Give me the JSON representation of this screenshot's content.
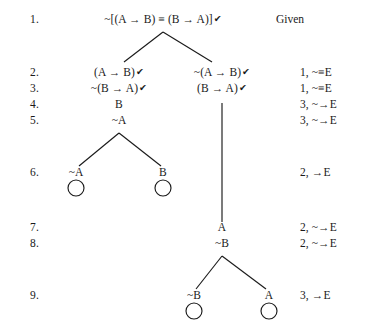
{
  "diagram": {
    "symbols": {
      "negation": "~",
      "conditional": "→",
      "biconditional": "≡",
      "check": "✔"
    },
    "line_numbers": [
      "1.",
      "2.",
      "3.",
      "4.",
      "5.",
      "6.",
      "7.",
      "8.",
      "9."
    ],
    "given_label": "Given",
    "nodes": [
      {
        "id": "n1",
        "line": 1,
        "text": "~[(A → B) ≡ (B → A)]",
        "checked": true,
        "x": 163,
        "y": 20
      },
      {
        "id": "n2L",
        "line": 2,
        "text": "(A → B)",
        "checked": true,
        "x": 119,
        "y": 73
      },
      {
        "id": "n3L",
        "line": 3,
        "text": "~(B → A)",
        "checked": true,
        "x": 119,
        "y": 89
      },
      {
        "id": "n4L",
        "line": 4,
        "text": "B",
        "checked": false,
        "x": 119,
        "y": 105
      },
      {
        "id": "n5L",
        "line": 5,
        "text": "~A",
        "checked": false,
        "x": 119,
        "y": 121
      },
      {
        "id": "n6La",
        "line": 6,
        "text": "~A",
        "checked": false,
        "x": 76,
        "y": 173
      },
      {
        "id": "n6Lb",
        "line": 6,
        "text": "B",
        "checked": false,
        "x": 163,
        "y": 173
      },
      {
        "id": "n2R",
        "line": 2,
        "text": "~(A → B)",
        "checked": true,
        "x": 222,
        "y": 73
      },
      {
        "id": "n3R",
        "line": 3,
        "text": "(B → A)",
        "checked": true,
        "x": 222,
        "y": 89
      },
      {
        "id": "n7R",
        "line": 7,
        "text": "A",
        "checked": false,
        "x": 222,
        "y": 228
      },
      {
        "id": "n8R",
        "line": 8,
        "text": "~B",
        "checked": false,
        "x": 222,
        "y": 244
      },
      {
        "id": "n9Ra",
        "line": 9,
        "text": "~B",
        "checked": false,
        "x": 194,
        "y": 296
      },
      {
        "id": "n9Rb",
        "line": 9,
        "text": "A",
        "checked": false,
        "x": 269,
        "y": 296
      }
    ],
    "justifications": [
      {
        "line": 2,
        "text": "1, ~≡E",
        "y": 73
      },
      {
        "line": 3,
        "text": "1, ~≡E",
        "y": 89
      },
      {
        "line": 4,
        "text": "3, ~→E",
        "y": 105
      },
      {
        "line": 5,
        "text": "3, ~→E",
        "y": 121
      },
      {
        "line": 6,
        "text": "2, →E",
        "y": 173
      },
      {
        "line": 7,
        "text": "2, ~→E",
        "y": 228
      },
      {
        "line": 8,
        "text": "2, ~→E",
        "y": 244
      },
      {
        "line": 9,
        "text": "3, →E",
        "y": 296
      }
    ],
    "open_branch_circles": [
      {
        "id": "c6a",
        "cx": 76,
        "cy": 188,
        "r": 8
      },
      {
        "id": "c6b",
        "cx": 163,
        "cy": 188,
        "r": 8
      },
      {
        "id": "c9a",
        "cx": 194,
        "cy": 311,
        "r": 8
      },
      {
        "id": "c9b",
        "cx": 269,
        "cy": 311,
        "r": 8
      }
    ],
    "edges": [
      {
        "id": "e-root-left",
        "x1": 163,
        "y1": 32,
        "x2": 124,
        "y2": 62
      },
      {
        "id": "e-root-right",
        "x1": 163,
        "y1": 32,
        "x2": 212,
        "y2": 62
      },
      {
        "id": "e-right-trunk",
        "x1": 222,
        "y1": 103,
        "x2": 222,
        "y2": 222
      },
      {
        "id": "e-n5-left",
        "x1": 119,
        "y1": 133,
        "x2": 79,
        "y2": 166
      },
      {
        "id": "e-n5-right",
        "x1": 119,
        "y1": 133,
        "x2": 161,
        "y2": 166
      },
      {
        "id": "e-n8-left",
        "x1": 222,
        "y1": 256,
        "x2": 196,
        "y2": 289
      },
      {
        "id": "e-n8-right",
        "x1": 222,
        "y1": 256,
        "x2": 266,
        "y2": 289
      }
    ],
    "line_number_positions": [
      {
        "label": "1.",
        "y": 20
      },
      {
        "label": "2.",
        "y": 73
      },
      {
        "label": "3.",
        "y": 89
      },
      {
        "label": "4.",
        "y": 105
      },
      {
        "label": "5.",
        "y": 121
      },
      {
        "label": "6.",
        "y": 173
      },
      {
        "label": "7.",
        "y": 228
      },
      {
        "label": "8.",
        "y": 244
      },
      {
        "label": "9.",
        "y": 296
      }
    ],
    "given": {
      "x": 276,
      "y": 20
    },
    "gutter_x": 30,
    "justification_x": 300,
    "stroke_color": "#1a1a1a"
  }
}
